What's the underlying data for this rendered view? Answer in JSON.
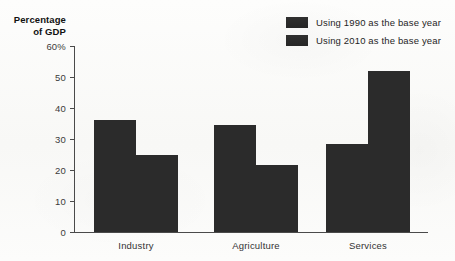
{
  "chart_data": {
    "type": "bar",
    "title": "",
    "xlabel": "",
    "ylabel": "Percentage of GDP",
    "ylabel_lines": [
      "Percentage",
      "of GDP"
    ],
    "categories": [
      "Industry",
      "Agriculture",
      "Services"
    ],
    "series": [
      {
        "name": "Using 1990 as the base year",
        "values": [
          36,
          34.5,
          28.5
        ],
        "color": "#2b2b2b"
      },
      {
        "name": "Using 2010 as the base year",
        "values": [
          25,
          21.5,
          52
        ],
        "color": "#2b2b2b"
      }
    ],
    "ylim": [
      0,
      60
    ],
    "ytick_values": [
      0,
      10,
      20,
      30,
      40,
      50,
      60
    ],
    "ytick_labels": [
      "0",
      "10",
      "20",
      "30",
      "40",
      "50",
      "60%"
    ],
    "grid": false,
    "legend_position": "top-right"
  },
  "legend": {
    "items": [
      {
        "label": "Using 1990 as the base year"
      },
      {
        "label": "Using 2010 as the base year"
      }
    ]
  }
}
